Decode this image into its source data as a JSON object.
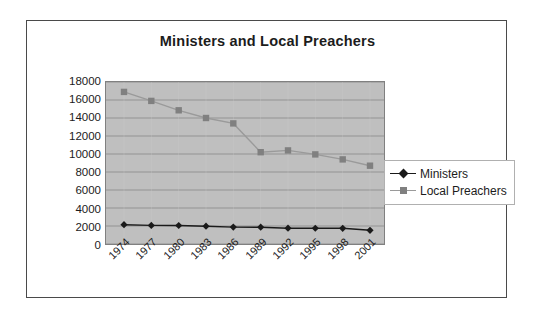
{
  "chart_data": {
    "type": "line",
    "title": "Ministers and Local Preachers",
    "xlabel": "",
    "ylabel": "",
    "categories": [
      "1974",
      "1977",
      "1980",
      "1983",
      "1986",
      "1989",
      "1992",
      "1995",
      "1998",
      "2001"
    ],
    "series": [
      {
        "name": "Ministers",
        "color": "#1a1a1a",
        "marker": "diamond",
        "values": [
          2150,
          2070,
          2060,
          1980,
          1880,
          1870,
          1760,
          1750,
          1740,
          1520
        ]
      },
      {
        "name": "Local Preachers",
        "color": "#808080",
        "marker": "square",
        "values": [
          16900,
          15900,
          14850,
          14000,
          13400,
          10200,
          10400,
          9950,
          9400,
          8700
        ]
      }
    ],
    "ylim": [
      0,
      18000
    ],
    "ytick_step": 2000,
    "yticks": [
      "18000",
      "16000",
      "14000",
      "12000",
      "10000",
      "8000",
      "6000",
      "4000",
      "2000",
      "0"
    ],
    "grid": "horizontal",
    "legend_position": "right",
    "plot_background": "#bfbfbf"
  },
  "legend": {
    "entries": [
      {
        "label": "Ministers"
      },
      {
        "label": "Local Preachers"
      }
    ]
  }
}
